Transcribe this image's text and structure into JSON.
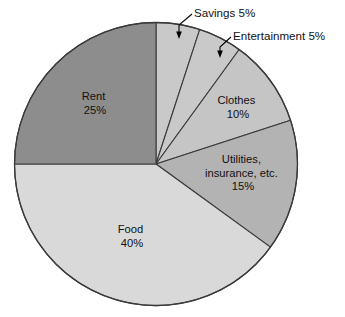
{
  "chart_data": {
    "type": "pie",
    "title": "",
    "subtitle": "",
    "xlabel": "",
    "ylabel": "",
    "legend_position": "none",
    "grid": false,
    "units": "percent",
    "total": 100,
    "start_angle_deg": 0,
    "direction": "clockwise",
    "categories": [
      "Savings",
      "Entertainment",
      "Clothes",
      "Utilities, insurance, etc.",
      "Food",
      "Rent"
    ],
    "values": [
      5,
      5,
      10,
      15,
      40,
      25
    ],
    "slices": [
      {
        "name": "Savings",
        "label_line1": "Savings 5%",
        "value": 5,
        "value_text": "5%",
        "color": "#c9c9c9",
        "label_placement": "callout",
        "angle_deg": 18
      },
      {
        "name": "Entertainment",
        "label_line1": "Entertainment 5%",
        "value": 5,
        "value_text": "5%",
        "color": "#c9c9c9",
        "label_placement": "callout",
        "angle_deg": 18
      },
      {
        "name": "Clothes",
        "label_line1": "Clothes",
        "label_line2": "10%",
        "value": 10,
        "value_text": "10%",
        "color": "#c5c5c5",
        "label_placement": "inside",
        "angle_deg": 36
      },
      {
        "name": "Utilities, insurance, etc.",
        "label_line1": "Utilities,",
        "label_line2": "insurance, etc.",
        "label_line3": "15%",
        "value": 15,
        "value_text": "15%",
        "color": "#b3b3b3",
        "label_placement": "inside",
        "angle_deg": 54
      },
      {
        "name": "Food",
        "label_line1": "Food",
        "label_line2": "40%",
        "value": 40,
        "value_text": "40%",
        "color": "#d9d9d9",
        "label_placement": "inside",
        "angle_deg": 144
      },
      {
        "name": "Rent",
        "label_line1": "Rent",
        "label_line2": "25%",
        "value": 25,
        "value_text": "25%",
        "color": "#8d8d8d",
        "label_placement": "inside",
        "angle_deg": 90
      }
    ]
  },
  "colors": {
    "background": "#ffffff",
    "outline": "#3a3a3a",
    "text": "#111111",
    "leader": "#000000"
  }
}
